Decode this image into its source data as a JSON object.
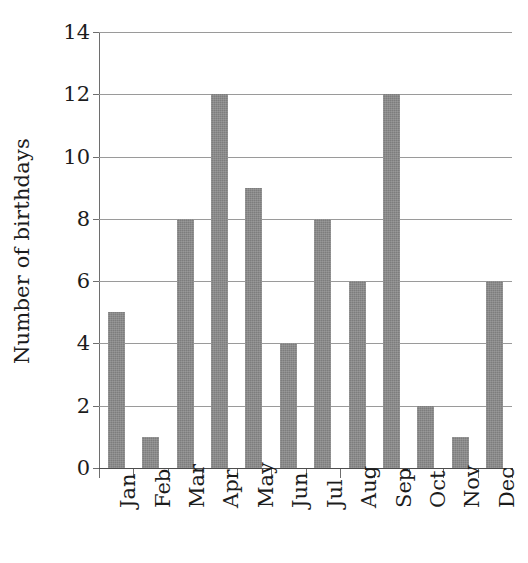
{
  "chart_data": {
    "type": "bar",
    "title": "",
    "xlabel": "",
    "ylabel": "Number of birthdays",
    "categories": [
      "Jan",
      "Feb",
      "Mar",
      "Apr",
      "May",
      "Jun",
      "Jul",
      "Aug",
      "Sep",
      "Oct",
      "Nov",
      "Dec"
    ],
    "values": [
      5,
      1,
      8,
      12,
      9,
      4,
      8,
      6,
      12,
      2,
      1,
      6
    ],
    "ylim": [
      0,
      14
    ],
    "ytick_labels": [
      "0",
      "2",
      "4",
      "6",
      "8",
      "10",
      "12",
      "14"
    ],
    "ytick_values": [
      0,
      2,
      4,
      6,
      8,
      10,
      12,
      14
    ],
    "grid": true,
    "legend": false,
    "bar_color": "#7d7d7d",
    "gridline_color": "#9a9a9a",
    "axis_color": "#4d4d4d",
    "text_color": "#1c1c1c",
    "xtick_rotation": -90
  }
}
